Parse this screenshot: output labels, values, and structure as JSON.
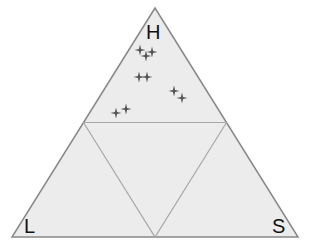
{
  "diagram": {
    "type": "ternary",
    "vertices": {
      "top": {
        "label": "H",
        "x": 155,
        "y": 8
      },
      "left": {
        "label": "L",
        "x": 12,
        "y": 237
      },
      "right": {
        "label": "S",
        "x": 298,
        "y": 237
      }
    },
    "colors": {
      "fill": "#ececec",
      "outline": "#888888",
      "inner_lines": "#a8a8a8",
      "marker": "#555555"
    },
    "markers": [
      {
        "x": 140,
        "y": 50
      },
      {
        "x": 146,
        "y": 56
      },
      {
        "x": 152,
        "y": 52
      },
      {
        "x": 139,
        "y": 77
      },
      {
        "x": 147,
        "y": 77
      },
      {
        "x": 174,
        "y": 91
      },
      {
        "x": 182,
        "y": 98
      },
      {
        "x": 116,
        "y": 113
      },
      {
        "x": 126,
        "y": 109
      }
    ]
  }
}
